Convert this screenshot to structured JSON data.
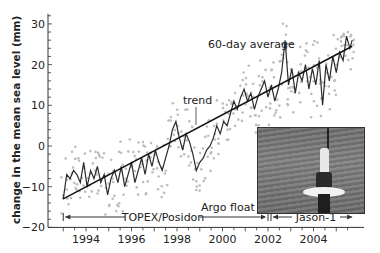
{
  "chart_data": {
    "type": "line",
    "title": "",
    "xlabel": "",
    "ylabel": "change in the mean sea level (mm)",
    "xlim": [
      1992.9,
      2005.8
    ],
    "ylim": [
      -20,
      33
    ],
    "x_ticks": [
      "1994",
      "1996",
      "1998",
      "2000",
      "2002",
      "2004"
    ],
    "y_ticks": [
      "-20",
      "-10",
      "0",
      "10",
      "20",
      "30"
    ],
    "grid": false,
    "annotations": [
      "60-day average",
      "trend",
      "Argo float",
      "TOPEX/Posidon",
      "Jason-1"
    ],
    "missions": [
      {
        "name": "TOPEX/Posidon",
        "start": 1993.0,
        "end": 2002.0
      },
      {
        "name": "Jason-1",
        "start": 2002.0,
        "end": 2005.7
      }
    ],
    "series": [
      {
        "name": "trend",
        "style": "straight line",
        "x": [
          1993.0,
          2005.7
        ],
        "values": [
          -13,
          24.5
        ]
      },
      {
        "name": "60-day average",
        "style": "jagged line",
        "x": [
          1993.0,
          1993.15,
          1993.3,
          1993.45,
          1993.6,
          1993.75,
          1993.9,
          1994.05,
          1994.2,
          1994.35,
          1994.5,
          1994.65,
          1994.8,
          1994.95,
          1995.1,
          1995.25,
          1995.4,
          1995.55,
          1995.7,
          1995.85,
          1996.0,
          1996.15,
          1996.3,
          1996.45,
          1996.6,
          1996.75,
          1996.9,
          1997.05,
          1997.2,
          1997.35,
          1997.5,
          1997.65,
          1997.8,
          1997.95,
          1998.1,
          1998.25,
          1998.4,
          1998.55,
          1998.7,
          1998.85,
          1999.0,
          1999.15,
          1999.3,
          1999.45,
          1999.6,
          1999.75,
          1999.9,
          2000.05,
          2000.2,
          2000.35,
          2000.5,
          2000.65,
          2000.8,
          2000.95,
          2001.1,
          2001.25,
          2001.4,
          2001.55,
          2001.7,
          2001.85,
          2002.0,
          2002.15,
          2002.3,
          2002.45,
          2002.6,
          2002.75,
          2002.9,
          2003.05,
          2003.2,
          2003.35,
          2003.5,
          2003.65,
          2003.8,
          2003.95,
          2004.1,
          2004.25,
          2004.4,
          2004.55,
          2004.7,
          2004.85,
          2005.0,
          2005.15,
          2005.3,
          2005.45,
          2005.6,
          2005.7
        ],
        "values": [
          -13,
          -7,
          -8,
          -6,
          -7,
          -9,
          -4,
          -10,
          -6,
          -8,
          -5,
          -9,
          -7,
          -12,
          -8,
          -6,
          -9,
          -5,
          -10,
          -7,
          -4,
          -9,
          -6,
          -3,
          -7,
          -2,
          -5,
          -1,
          -4,
          -6,
          -3,
          0,
          4,
          6,
          2,
          -1,
          3,
          1,
          -2,
          -6,
          -4,
          -3,
          -1,
          0,
          2,
          5,
          3,
          6,
          5,
          8,
          11,
          9,
          12,
          14,
          11,
          13,
          9,
          12,
          14,
          16,
          12,
          15,
          11,
          14,
          18,
          26,
          15,
          19,
          13,
          18,
          16,
          20,
          14,
          19,
          15,
          21,
          10,
          20,
          16,
          22,
          18,
          23,
          21,
          27,
          24,
          26
        ]
      },
      {
        "name": "individual measurements",
        "style": "light gray dots",
        "note": "scattered points roughly ±5 mm around the 60-day average"
      }
    ]
  },
  "labels": {
    "ylabel": "change in the mean sea level (mm)",
    "avg": "60-day average",
    "trend": "trend",
    "argo": "Argo float",
    "topex": "TOPEX/Posidon",
    "jason": "Jason-1"
  },
  "colors": {
    "line": "#2b2b2b",
    "dots": "#bdbdbd",
    "axis": "#333333",
    "text": "#222222"
  }
}
